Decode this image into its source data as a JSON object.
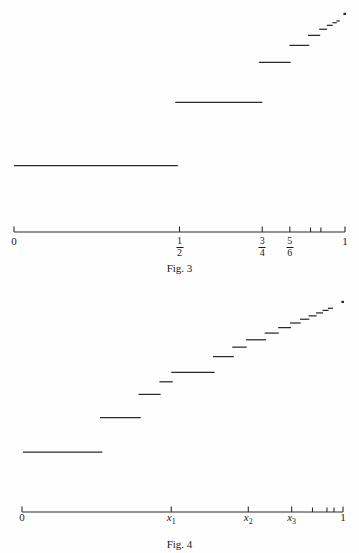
{
  "page": {
    "background_color": "#fefefe",
    "ink_color": "#2a2a2a",
    "width": 359,
    "height": 553
  },
  "figures": [
    {
      "id": "fig-3",
      "caption": "Fig. 3",
      "axis": {
        "x_start_label": "0",
        "x_end_label": "1",
        "domain": [
          0,
          1
        ],
        "pixel_left": 14,
        "pixel_right": 345,
        "pixel_y": 232,
        "tick_marks": [
          {
            "value": 0,
            "label": "0",
            "label_type": "plain",
            "major": true
          },
          {
            "value": 0.5,
            "label": "1/2",
            "numerator": "1",
            "denominator": "2",
            "label_type": "fraction",
            "major": true
          },
          {
            "value": 0.75,
            "label": "3/4",
            "numerator": "3",
            "denominator": "4",
            "label_type": "fraction",
            "major": true
          },
          {
            "value": 0.8333,
            "label": "5/6",
            "numerator": "5",
            "denominator": "6",
            "label_type": "fraction",
            "major": true
          },
          {
            "value": 0.8958,
            "label": "",
            "label_type": "none",
            "major": false
          },
          {
            "value": 0.9271,
            "label": "",
            "label_type": "none",
            "major": false
          },
          {
            "value": 1.0,
            "label": "1",
            "label_type": "plain",
            "major": true
          }
        ]
      },
      "chart_data": {
        "type": "line",
        "title": "Fig. 3",
        "subtitle": "Increasing step function with jump discontinuities at 1/2, 3/4, 5/6, ...",
        "xlabel": "",
        "ylabel": "",
        "xlim": [
          0,
          1
        ],
        "ylim": [
          0,
          1
        ],
        "grid": false,
        "legend": false,
        "steps": [
          {
            "index": 1,
            "x_start": 0.0,
            "x_end": 0.495,
            "y": 0.305
          },
          {
            "index": 2,
            "x_start": 0.487,
            "x_end": 0.75,
            "y": 0.595
          },
          {
            "index": 3,
            "x_start": 0.74,
            "x_end": 0.836,
            "y": 0.778
          },
          {
            "index": 4,
            "x_start": 0.832,
            "x_end": 0.892,
            "y": 0.856
          },
          {
            "index": 5,
            "x_start": 0.888,
            "x_end": 0.925,
            "y": 0.902
          },
          {
            "index": 6,
            "x_start": 0.922,
            "x_end": 0.946,
            "y": 0.93
          },
          {
            "index": 7,
            "x_start": 0.945,
            "x_end": 0.963,
            "y": 0.948
          },
          {
            "index": 8,
            "x_start": 0.962,
            "x_end": 0.975,
            "y": 0.96
          },
          {
            "index": 9,
            "x_start": 0.974,
            "x_end": 0.984,
            "y": 0.968
          }
        ],
        "limit_point": {
          "x": 1.0,
          "y": 1.0
        }
      }
    },
    {
      "id": "fig-4",
      "caption": "Fig. 4",
      "axis": {
        "x_start_label": "0",
        "x_end_label": "1",
        "domain": [
          0,
          1
        ],
        "pixel_left": 22,
        "pixel_right": 343,
        "pixel_y": 512,
        "tick_marks": [
          {
            "value": 0,
            "label": "0",
            "label_type": "plain",
            "major": true
          },
          {
            "value": 0.465,
            "label": "x1",
            "label_base": "x",
            "label_sub": "1",
            "label_type": "variable",
            "major": true
          },
          {
            "value": 0.705,
            "label": "x2",
            "label_base": "x",
            "label_sub": "2",
            "label_type": "variable",
            "major": true
          },
          {
            "value": 0.84,
            "label": "x3",
            "label_base": "x",
            "label_sub": "3",
            "label_type": "variable",
            "major": true
          },
          {
            "value": 0.905,
            "label": "",
            "label_type": "none",
            "major": false
          },
          {
            "value": 0.95,
            "label": "",
            "label_type": "none",
            "major": false
          },
          {
            "value": 0.972,
            "label": "",
            "label_type": "none",
            "major": false
          },
          {
            "value": 1.0,
            "label": "1",
            "label_type": "plain",
            "major": true
          }
        ]
      },
      "chart_data": {
        "type": "line",
        "title": "Fig. 4",
        "subtitle": "Increasing step function with jumps at x1, x2, x3, ... accumulating at 1",
        "xlabel": "",
        "ylabel": "",
        "xlim": [
          0,
          1
        ],
        "ylim": [
          0,
          1
        ],
        "grid": false,
        "legend": false,
        "steps": [
          {
            "index": 1,
            "x_start": 0.003,
            "x_end": 0.25,
            "y": 0.285
          },
          {
            "index": 2,
            "x_start": 0.243,
            "x_end": 0.37,
            "y": 0.45
          },
          {
            "index": 3,
            "x_start": 0.363,
            "x_end": 0.432,
            "y": 0.56
          },
          {
            "index": 4,
            "x_start": 0.428,
            "x_end": 0.47,
            "y": 0.62
          },
          {
            "index": 5,
            "x_start": 0.465,
            "x_end": 0.6,
            "y": 0.665
          },
          {
            "index": 6,
            "x_start": 0.595,
            "x_end": 0.66,
            "y": 0.74
          },
          {
            "index": 7,
            "x_start": 0.655,
            "x_end": 0.7,
            "y": 0.785
          },
          {
            "index": 8,
            "x_start": 0.698,
            "x_end": 0.76,
            "y": 0.82
          },
          {
            "index": 9,
            "x_start": 0.756,
            "x_end": 0.8,
            "y": 0.852
          },
          {
            "index": 10,
            "x_start": 0.798,
            "x_end": 0.838,
            "y": 0.878
          },
          {
            "index": 11,
            "x_start": 0.835,
            "x_end": 0.868,
            "y": 0.9
          },
          {
            "index": 12,
            "x_start": 0.866,
            "x_end": 0.895,
            "y": 0.918
          },
          {
            "index": 13,
            "x_start": 0.893,
            "x_end": 0.918,
            "y": 0.934
          },
          {
            "index": 14,
            "x_start": 0.916,
            "x_end": 0.938,
            "y": 0.948
          },
          {
            "index": 15,
            "x_start": 0.936,
            "x_end": 0.955,
            "y": 0.96
          },
          {
            "index": 16,
            "x_start": 0.953,
            "x_end": 0.969,
            "y": 0.97
          }
        ],
        "limit_point": {
          "x": 1.0,
          "y": 1.0
        }
      }
    }
  ]
}
